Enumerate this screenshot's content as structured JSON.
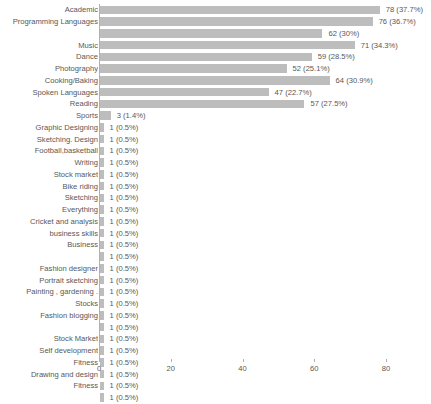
{
  "chart_data": {
    "type": "bar",
    "orientation": "horizontal",
    "title": "",
    "subtitle": "",
    "xlabel": "",
    "ylabel": "",
    "xlim": [
      0,
      83
    ],
    "xticks": [
      0,
      20,
      40,
      60,
      80
    ],
    "grid": false,
    "legend": false,
    "bar_color": "#bdbdbd",
    "text_color": "#585858",
    "axis_color": "#b0b0b0",
    "categories": [
      "Academic",
      "Programming Languages",
      "",
      "Music",
      "Dance",
      "Photography",
      "Cooking/Baking",
      "Spoken Languages",
      "Reading",
      "Sports",
      "Graphic Designing",
      "Sketching. Design",
      "Football,basketball",
      "Writing",
      "Stock market",
      "Bike riding",
      "Sketching",
      "Everything",
      "Cricket and analysis",
      "business skills",
      "Business",
      "",
      "Fashion designer",
      "Portrait sketching",
      "Painting , gardening .",
      "Stocks",
      "Fashion blogging",
      "",
      "Stock Market",
      "Self development",
      "Fitness",
      "Drawing and design",
      "Fitness",
      ""
    ],
    "values": [
      78,
      76,
      62,
      71,
      59,
      52,
      64,
      47,
      57,
      3,
      1,
      1,
      1,
      1,
      1,
      1,
      1,
      1,
      1,
      1,
      1,
      1,
      1,
      1,
      1,
      1,
      1,
      1,
      1,
      1,
      1,
      1,
      1,
      1
    ],
    "percentages": [
      "37.7%",
      "36.7%",
      "30%",
      "34.3%",
      "28.5%",
      "25.1%",
      "30.9%",
      "22.7%",
      "27.5%",
      "1.4%",
      "0.5%",
      "0.5%",
      "0.5%",
      "0.5%",
      "0.5%",
      "0.5%",
      "0.5%",
      "0.5%",
      "0.5%",
      "0.5%",
      "0.5%",
      "0.5%",
      "0.5%",
      "0.5%",
      "0.5%",
      "0.5%",
      "0.5%",
      "0.5%",
      "0.5%",
      "0.5%",
      "0.5%",
      "0.5%",
      "0.5%",
      "0.5%"
    ],
    "data_labels": [
      "78 (37.7%)",
      "76 (36.7%)",
      "62 (30%)",
      "71 (34.3%)",
      "59 (28.5%)",
      "52 (25.1%)",
      "64 (30.9%)",
      "47 (22.7%)",
      "57 (27.5%)",
      "3 (1.4%)",
      "1 (0.5%)",
      "1 (0.5%)",
      "1 (0.5%)",
      "1 (0.5%)",
      "1 (0.5%)",
      "1 (0.5%)",
      "1 (0.5%)",
      "1 (0.5%)",
      "1 (0.5%)",
      "1 (0.5%)",
      "1 (0.5%)",
      "1 (0.5%)",
      "1 (0.5%)",
      "1 (0.5%)",
      "1 (0.5%)",
      "1 (0.5%)",
      "1 (0.5%)",
      "1 (0.5%)",
      "1 (0.5%)",
      "1 (0.5%)",
      "1 (0.5%)",
      "1 (0.5%)",
      "1 (0.5%)",
      "1 (0.5%)"
    ]
  }
}
